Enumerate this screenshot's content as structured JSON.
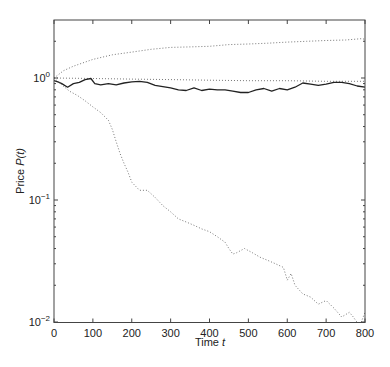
{
  "chart_data": {
    "type": "line",
    "title": "",
    "xlabel": "Time t",
    "ylabel": "Price P(t)",
    "xscale": "linear",
    "yscale": "log",
    "xlim": [
      0,
      800
    ],
    "ylim": [
      0.01,
      3
    ],
    "xticks": [
      0,
      100,
      200,
      300,
      400,
      500,
      600,
      700,
      800
    ],
    "xtick_labels": [
      "0",
      "100",
      "200",
      "300",
      "400",
      "500",
      "600",
      "700",
      "800"
    ],
    "yticks": [
      0.01,
      0.1,
      1
    ],
    "ytick_labels": [
      {
        "base": "10",
        "exp": "−2"
      },
      {
        "base": "10",
        "exp": "−1"
      },
      {
        "base": "10",
        "exp": "0"
      }
    ],
    "grid": false,
    "legend": null,
    "series": [
      {
        "name": "upper dotted bound",
        "style": "dotted",
        "color": "#777777",
        "x": [
          0,
          25,
          50,
          100,
          150,
          200,
          250,
          300,
          350,
          400,
          450,
          500,
          550,
          600,
          650,
          700,
          750,
          790,
          800
        ],
        "y": [
          1.0,
          1.15,
          1.25,
          1.42,
          1.55,
          1.63,
          1.72,
          1.78,
          1.8,
          1.82,
          1.88,
          1.9,
          1.93,
          1.97,
          2.0,
          2.03,
          2.05,
          2.1,
          2.08
        ]
      },
      {
        "name": "flat dotted reference",
        "style": "dotted",
        "color": "#777777",
        "x": [
          0,
          100,
          200,
          300,
          400,
          500,
          600,
          700,
          800
        ],
        "y": [
          1.0,
          0.99,
          0.98,
          0.97,
          0.96,
          0.95,
          0.95,
          0.94,
          0.94
        ]
      },
      {
        "name": "price path",
        "style": "solid",
        "color": "#222222",
        "x": [
          0,
          10,
          20,
          35,
          50,
          65,
          80,
          95,
          105,
          120,
          140,
          160,
          180,
          200,
          220,
          240,
          260,
          280,
          300,
          320,
          340,
          360,
          380,
          400,
          420,
          440,
          460,
          480,
          500,
          520,
          540,
          560,
          580,
          600,
          620,
          640,
          660,
          680,
          700,
          720,
          740,
          760,
          780,
          800
        ],
        "y": [
          0.95,
          0.93,
          0.9,
          0.84,
          0.9,
          0.92,
          0.97,
          0.99,
          0.9,
          0.88,
          0.9,
          0.88,
          0.91,
          0.93,
          0.94,
          0.92,
          0.87,
          0.85,
          0.83,
          0.8,
          0.79,
          0.83,
          0.79,
          0.81,
          0.8,
          0.8,
          0.78,
          0.76,
          0.76,
          0.8,
          0.82,
          0.78,
          0.82,
          0.8,
          0.84,
          0.91,
          0.89,
          0.87,
          0.89,
          0.92,
          0.92,
          0.9,
          0.86,
          0.84
        ]
      },
      {
        "name": "lower dotted bound",
        "style": "dotted",
        "color": "#777777",
        "x": [
          0,
          20,
          40,
          60,
          80,
          100,
          120,
          140,
          150,
          160,
          170,
          180,
          190,
          200,
          220,
          240,
          260,
          280,
          300,
          320,
          340,
          360,
          380,
          400,
          420,
          440,
          450,
          460,
          470,
          490,
          510,
          530,
          550,
          570,
          590,
          600,
          610,
          620,
          640,
          660,
          680,
          700,
          720,
          740,
          760,
          770,
          780,
          790,
          800
        ],
        "y": [
          1.0,
          0.88,
          0.78,
          0.72,
          0.65,
          0.58,
          0.52,
          0.45,
          0.38,
          0.3,
          0.24,
          0.2,
          0.17,
          0.14,
          0.12,
          0.12,
          0.105,
          0.09,
          0.08,
          0.07,
          0.066,
          0.062,
          0.058,
          0.055,
          0.05,
          0.045,
          0.04,
          0.036,
          0.037,
          0.04,
          0.037,
          0.034,
          0.032,
          0.03,
          0.028,
          0.022,
          0.025,
          0.02,
          0.017,
          0.016,
          0.014,
          0.015,
          0.013,
          0.011,
          0.012,
          0.011,
          0.009,
          0.0095,
          0.012
        ]
      }
    ]
  }
}
